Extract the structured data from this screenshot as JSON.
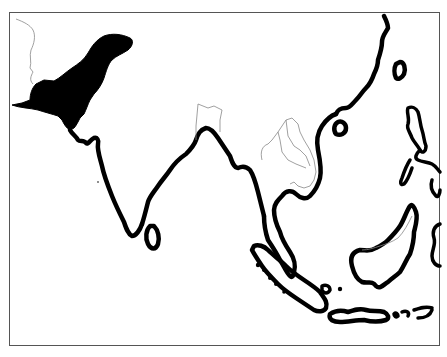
{
  "map": {
    "type": "distribution-range-map",
    "region": "South and Southeast Asia",
    "colors": {
      "background": "#ffffff",
      "coastline": "#000000",
      "political_border": "#888888",
      "range_fill": "#000000",
      "frame": "#555555"
    },
    "shaded_range": "northwestern South Asia (Pakistan / Afghanistan / NW India highlands)",
    "visible_features": [
      "Indian subcontinent",
      "Sri Lanka",
      "Bangladesh border",
      "Myanmar / Thailand / Laos / Cambodia / Vietnam borders",
      "South China coast",
      "Hainan",
      "Taiwan",
      "Philippines",
      "Malay Peninsula",
      "Sumatra",
      "Borneo",
      "Java and Lesser Sunda Islands",
      "Sulawesi (partial)"
    ]
  }
}
